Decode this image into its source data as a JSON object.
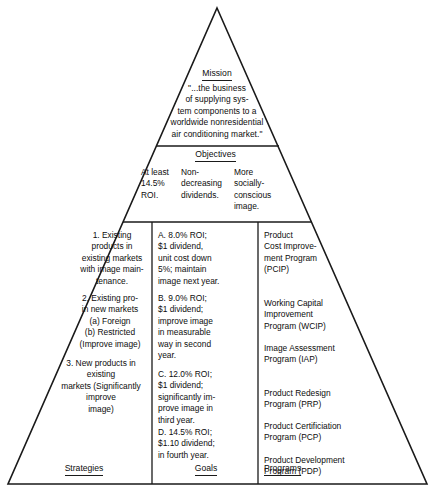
{
  "diagram": {
    "type": "strategic-planning-pyramid",
    "mission": {
      "title": "Mission",
      "body": "\"...the business\nof supplying sys-\ntem components to a\nworldwide nonresidential\nair conditioning market.\""
    },
    "objectives": {
      "title": "Objectives",
      "columns": [
        "At least\n14.5%\nROI.",
        "Non-\ndecreasing\ndividends.",
        "More\nsocially-\nconscious\nimage."
      ]
    },
    "strategies": {
      "label": "Strategies",
      "items": [
        "1.  Existing\nproducts in\nexisting markets\nwith image main-\ntenance.",
        "2.  Existing pro-\nin new markets\n(a) Foreign\n(b) Restricted\n(Improve image)",
        "3.  New products in existing\nmarkets (Significantly improve\nimage)"
      ]
    },
    "goals": {
      "label": "Goals",
      "items": [
        "A.  8.0% ROI;\n$1 dividend,\nunit cost down\n5%; maintain\nimage next year.",
        "B.  9.0% ROI;\n$1 dividend;\nimprove image\nin measurable\nway in second\nyear.",
        "C.  12.0% ROI;\n$1 dividend;\nsignificantly im-\nprove image in\nthird year.",
        "D.  14.5% ROI;\n$1.10 dividend;\nin fourth year."
      ]
    },
    "programs": {
      "label": "Programs",
      "items": [
        "Product\nCost Improve-\nment Program\n(PCIP)",
        "Working Capital\nImprovement\nProgram (WCIP)",
        "Image Assessment\nProgram (IAP)",
        "Product Redesign\nProgram (PRP)",
        "Product Certificiation\nProgram (PCP)",
        "Product Development\nProgram (PDP)"
      ]
    },
    "colors": {
      "line": "#1a1a1a",
      "text": "#0d0d0d",
      "background": "#ffffff"
    }
  }
}
